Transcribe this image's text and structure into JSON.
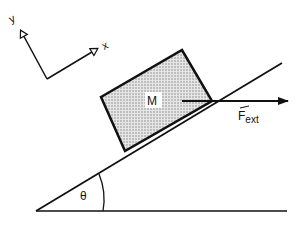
{
  "diagram": {
    "type": "inclined-plane-free-body",
    "axes": {
      "x_label": "x",
      "y_label": "y"
    },
    "block": {
      "label": "M",
      "fill_pattern": "stippled"
    },
    "force": {
      "label_main": "F",
      "label_sub": "ext",
      "vector_marker": "→",
      "direction": "horizontal-right"
    },
    "angle": {
      "label": "θ"
    },
    "colors": {
      "line": "#111111",
      "background": "#ffffff",
      "stipple": "#888888"
    }
  }
}
